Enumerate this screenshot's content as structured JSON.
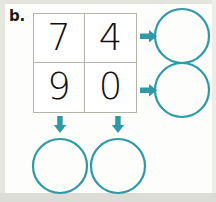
{
  "worksheet": {
    "exercise_label": "b.",
    "background_color": "#fdfdfb",
    "grid_border_color": "#b4b4ab",
    "accent_color": "#2f9aa6",
    "digit_color": "#111111"
  },
  "digit_grid": {
    "name": "two-by-two-digit-grid",
    "rows": [
      {
        "name": "grid-row-top",
        "cells": [
          {
            "name": "grid-cell-row1-col1",
            "value": "7"
          },
          {
            "name": "grid-cell-row1-col2",
            "value": "4"
          }
        ]
      },
      {
        "name": "grid-row-bottom",
        "cells": [
          {
            "name": "grid-cell-row2-col1",
            "value": "9"
          },
          {
            "name": "grid-cell-row2-col2",
            "value": "0"
          }
        ]
      }
    ]
  },
  "arrows": [
    {
      "name": "arrow-right-row1",
      "direction": "right",
      "color": "#2f9aa6"
    },
    {
      "name": "arrow-right-row2",
      "direction": "right",
      "color": "#2f9aa6"
    },
    {
      "name": "arrow-down-col1",
      "direction": "down",
      "color": "#2f9aa6"
    },
    {
      "name": "arrow-down-col2",
      "direction": "down",
      "color": "#2f9aa6"
    }
  ],
  "answer_circles": [
    {
      "name": "answer-circle-row1",
      "value": "",
      "cx": 182,
      "cy": 36,
      "r": 27
    },
    {
      "name": "answer-circle-row2",
      "value": "",
      "cx": 182,
      "cy": 90,
      "r": 27
    },
    {
      "name": "answer-circle-col1",
      "value": "",
      "cx": 60,
      "cy": 166,
      "r": 27
    },
    {
      "name": "answer-circle-col2",
      "value": "",
      "cx": 118,
      "cy": 166,
      "r": 27
    }
  ]
}
